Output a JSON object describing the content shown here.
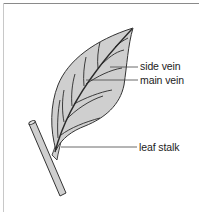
{
  "diagram": {
    "subject": "leaf",
    "colors": {
      "leaf_fill": "#cfcfcf",
      "outline": "#333333",
      "vein": "#2a2a2a",
      "leader_line": "#444444",
      "frame": "#8a8a8a"
    },
    "labels": [
      {
        "id": "side-vein",
        "text": "side vein"
      },
      {
        "id": "main-vein",
        "text": "main vein"
      },
      {
        "id": "leaf-stalk",
        "text": "leaf stalk"
      }
    ]
  }
}
